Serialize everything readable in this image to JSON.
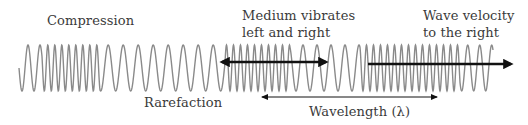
{
  "diagram": {
    "colors": {
      "wave": "#8a8a8a",
      "arrow": "#111111",
      "text": "#3a3a3a",
      "background": "#ffffff"
    },
    "labels": {
      "compression": "Compression",
      "rarefaction": "Rarefaction",
      "medium_line1": "Medium vibrates",
      "medium_line2": "left and right",
      "velocity_line1": "Wave velocity",
      "velocity_line2": "to the right",
      "wavelength": "Wavelength (λ)"
    },
    "wave": {
      "x_start": 19,
      "x_end": 493,
      "center_y": 68,
      "amplitude": 23,
      "segments": [
        {
          "from": 19,
          "to": 42,
          "period": 12
        },
        {
          "from": 42,
          "to": 100,
          "period": 7
        },
        {
          "from": 100,
          "to": 225,
          "period": 15
        },
        {
          "from": 225,
          "to": 290,
          "period": 7
        },
        {
          "from": 290,
          "to": 360,
          "period": 14
        },
        {
          "from": 360,
          "to": 460,
          "period": 7
        },
        {
          "from": 460,
          "to": 493,
          "period": 12
        }
      ]
    },
    "arrows": {
      "medium": {
        "x1": 222,
        "x2": 326,
        "y": 62,
        "type": "double",
        "weight": "thick"
      },
      "velocity": {
        "x1": 368,
        "x2": 511,
        "y": 64,
        "type": "single",
        "weight": "thick"
      },
      "wavelength": {
        "x1": 262,
        "x2": 437,
        "y": 97,
        "type": "double",
        "weight": "thin"
      }
    }
  }
}
